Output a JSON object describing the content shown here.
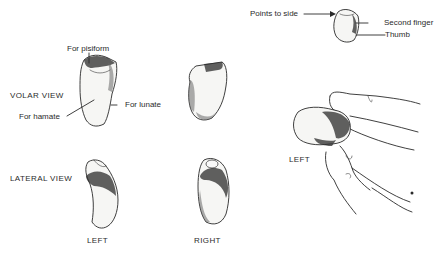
{
  "diagram": {
    "labels": {
      "for_pisiform": "For pisiform",
      "volar_view": "VOLAR VIEW",
      "for_lunate": "For lunate",
      "for_hamate": "For hamate",
      "lateral_view": "LATERAL VIEW",
      "left_bottom": "LEFT",
      "right_bottom": "RIGHT",
      "points_to_side": "Points to side",
      "second_finger": "Second finger",
      "thumb": "Thumb",
      "left_hand": "LEFT"
    },
    "colors": {
      "ink": "#2a2a2a",
      "paper": "#ffffff"
    }
  }
}
